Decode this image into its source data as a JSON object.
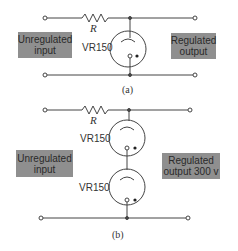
{
  "panels": {
    "a": {
      "caption": "(a)",
      "resistor_label": "R",
      "tube_labels": [
        "VR150"
      ],
      "input_label": "Unregulated input",
      "output_label": "Regulated output"
    },
    "b": {
      "caption": "(b)",
      "resistor_label": "R",
      "tube_labels": [
        "VR150",
        "VR150"
      ],
      "input_label": "Unregulated input",
      "output_label": "Regulated output 300 v"
    }
  },
  "colors": {
    "wire": "#444444",
    "label_box": "#8f8f8f",
    "background": "#ffffff"
  }
}
